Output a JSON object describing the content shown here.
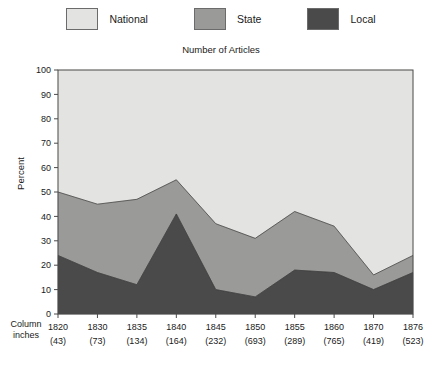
{
  "legend": {
    "items": [
      {
        "label": "National",
        "color": "#e3e3e1",
        "name": "legend-item-national"
      },
      {
        "label": "State",
        "color": "#9a9a98",
        "name": "legend-item-state"
      },
      {
        "label": "Local",
        "color": "#4a4a4a",
        "name": "legend-item-local"
      }
    ]
  },
  "axes": {
    "y_title": "Percent",
    "row_label_line1": "Column",
    "row_label_line2": "inches"
  },
  "chart_data": {
    "type": "area",
    "title": "Number of Articles",
    "xlabel": "",
    "ylabel": "Percent",
    "ylim": [
      0,
      100
    ],
    "yticks": [
      0,
      10,
      20,
      30,
      40,
      50,
      60,
      70,
      80,
      90,
      100
    ],
    "grid": false,
    "legend_position": "top",
    "stacked": true,
    "categories": [
      "1820",
      "1830",
      "1835",
      "1840",
      "1845",
      "1850",
      "1855",
      "1860",
      "1870",
      "1876"
    ],
    "column_inches": [
      "(43)",
      "(73)",
      "(134)",
      "(164)",
      "(232)",
      "(693)",
      "(289)",
      "(765)",
      "(419)",
      "(523)"
    ],
    "series": [
      {
        "name": "Local",
        "color": "#4a4a4a",
        "values": [
          24,
          17,
          12,
          41,
          10,
          7,
          18,
          17,
          10,
          17
        ]
      },
      {
        "name": "State",
        "color": "#9a9a98",
        "values": [
          26,
          28,
          35,
          14,
          27,
          24,
          24,
          19,
          6,
          7
        ]
      },
      {
        "name": "National",
        "color": "#e3e3e1",
        "values": [
          50,
          55,
          53,
          45,
          63,
          69,
          58,
          64,
          84,
          76
        ]
      }
    ],
    "cumulative_local": [
      24,
      17,
      12,
      41,
      10,
      7,
      18,
      17,
      10,
      17
    ],
    "cumulative_state": [
      50,
      45,
      47,
      55,
      37,
      31,
      42,
      36,
      16,
      24
    ],
    "cumulative_total": [
      100,
      100,
      100,
      100,
      100,
      100,
      100,
      100,
      100,
      100
    ]
  }
}
